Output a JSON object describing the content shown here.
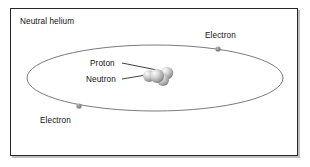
{
  "figure": {
    "title": "Neutral helium",
    "background_color": "#ffffff",
    "frame_color": "#262626",
    "labels": {
      "title": "Neutral helium",
      "electron_top": "Electron",
      "electron_bottom": "Electron",
      "proton": "Proton",
      "neutron": "Neutron"
    },
    "orbit": {
      "shape": "ellipse",
      "center_x": 155,
      "center_y": 78,
      "radius_x": 128,
      "radius_y": 33,
      "stroke_color": "#6b6b6b"
    },
    "electrons": [
      {
        "name": "electron-top-right",
        "x": 218,
        "y": 49,
        "radius": 2.6,
        "color": "#8a8a8a"
      },
      {
        "name": "electron-bottom-left",
        "x": 79,
        "y": 106,
        "radius": 2.6,
        "color": "#8a8a8a"
      }
    ],
    "nucleus": {
      "particle_color_light": "#f2f2f2",
      "particle_color_dark": "#8d8d8d",
      "particles": [
        {
          "name": "neutron-back-left",
          "x": 149,
          "y": 76,
          "r": 6.0
        },
        {
          "name": "proton-back-right",
          "x": 167,
          "y": 73,
          "r": 6.2
        },
        {
          "name": "neutron-front-right",
          "x": 163,
          "y": 80,
          "r": 6.0
        },
        {
          "name": "proton-front-left",
          "x": 157,
          "y": 76,
          "r": 7.0
        }
      ]
    },
    "leader_lines": [
      {
        "name": "proton-leader",
        "x1": 122,
        "y1": 63,
        "x2": 162,
        "y2": 71
      },
      {
        "name": "neutron-leader",
        "x1": 122,
        "y1": 79,
        "x2": 146,
        "y2": 75
      }
    ]
  }
}
